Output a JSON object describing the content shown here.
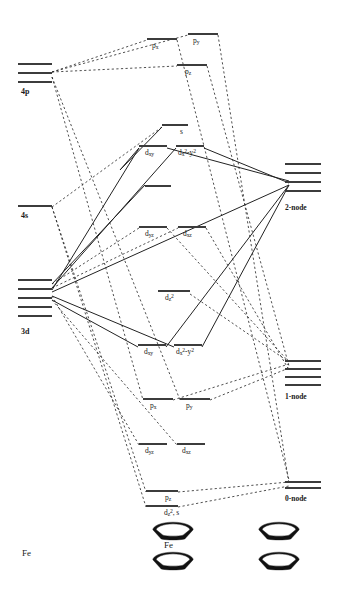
{
  "diagram": {
    "title_label": "Fe",
    "type": "ferrocene-molecular-orbital-correlation-diagram"
  },
  "left_atom": {
    "label": "Fe",
    "levels": [
      {
        "name": "4p",
        "label": "4p",
        "degeneracy": 3,
        "x": 18,
        "y": 63,
        "width": 34,
        "spacing": 9,
        "label_x": 21,
        "label_y": 88
      },
      {
        "name": "4s",
        "label": "4s",
        "degeneracy": 1,
        "x": 18,
        "y": 205,
        "width": 34,
        "spacing": 0,
        "label_x": 21,
        "label_y": 212
      },
      {
        "name": "3d",
        "label": "3d",
        "degeneracy": 5,
        "x": 18,
        "y": 279,
        "width": 34,
        "spacing": 9,
        "label_x": 21,
        "label_y": 328
      }
    ]
  },
  "molecular_orbitals": [
    {
      "name": "mo-px-antibonding",
      "label_html": "p<sub>x</sub>",
      "x": 147,
      "y": 38,
      "width": 30,
      "label_x": 152,
      "label_y": 42,
      "label_above": true
    },
    {
      "name": "mo-py-antibonding",
      "label_html": "p<sub>y</sub>",
      "x": 188,
      "y": 33,
      "width": 30,
      "label_x": 193,
      "label_y": 37,
      "label_above": true
    },
    {
      "name": "mo-pz-antibonding",
      "label_html": "p<sub>z</sub>",
      "x": 177,
      "y": 64,
      "width": 30,
      "label_x": 185,
      "label_y": 68,
      "label_above": false
    },
    {
      "name": "mo-s-antibonding",
      "label_html": "s",
      "x": 162,
      "y": 124,
      "width": 26,
      "label_x": 180,
      "label_y": 128,
      "label_above": false
    },
    {
      "name": "mo-dxy-antibonding",
      "label_html": "d<sub>xy</sub>",
      "x": 139,
      "y": 145,
      "width": 28,
      "label_x": 145,
      "label_y": 149,
      "label_above": true
    },
    {
      "name": "mo-dx2y2-antibonding",
      "label_html": "d<sub>x</sub><sup>2</sup>-y<sup>2</sup>",
      "x": 176,
      "y": 145,
      "width": 28,
      "label_x": 178,
      "label_y": 149,
      "label_above": true
    },
    {
      "name": "mo-nonbonding-mid",
      "label_html": "",
      "x": 145,
      "y": 185,
      "width": 26,
      "label_x": 0,
      "label_y": 0,
      "label_above": false
    },
    {
      "name": "mo-dyz-nonbonding",
      "label_html": "d<sub>yz</sub>",
      "x": 139,
      "y": 226,
      "width": 28,
      "label_x": 145,
      "label_y": 230,
      "label_above": true
    },
    {
      "name": "mo-dxz-nonbonding",
      "label_html": "d<sub>xz</sub>",
      "x": 178,
      "y": 226,
      "width": 28,
      "label_x": 183,
      "label_y": 230,
      "label_above": true
    },
    {
      "name": "mo-dz2-nonbonding",
      "label_html": "d<sub>z</sub><sup>2</sup>",
      "x": 158,
      "y": 290,
      "width": 32,
      "label_x": 165,
      "label_y": 294,
      "label_above": false
    },
    {
      "name": "mo-dxy-bonding",
      "label_html": "d<sub>xy</sub>",
      "x": 138,
      "y": 344,
      "width": 28,
      "label_x": 144,
      "label_y": 348,
      "label_above": false
    },
    {
      "name": "mo-dx2y2-bonding",
      "label_html": "d<sub>x</sub><sup>2</sup>-y<sup>2</sup>",
      "x": 174,
      "y": 344,
      "width": 28,
      "label_x": 176,
      "label_y": 348,
      "label_above": false
    },
    {
      "name": "mo-px-bonding",
      "label_html": "p<sub>x</sub>",
      "x": 143,
      "y": 398,
      "width": 30,
      "label_x": 150,
      "label_y": 402,
      "label_above": false
    },
    {
      "name": "mo-py-bonding",
      "label_html": "p<sub>y</sub>",
      "x": 180,
      "y": 398,
      "width": 30,
      "label_x": 186,
      "label_y": 402,
      "label_above": false
    },
    {
      "name": "mo-dyz-bonding",
      "label_html": "d<sub>yz</sub>",
      "x": 139,
      "y": 443,
      "width": 28,
      "label_x": 145,
      "label_y": 447,
      "label_above": true
    },
    {
      "name": "mo-dxz-bonding",
      "label_html": "d<sub>xz</sub>",
      "x": 177,
      "y": 443,
      "width": 28,
      "label_x": 182,
      "label_y": 447,
      "label_above": true
    },
    {
      "name": "mo-pz-bonding",
      "label_html": "p<sub>z</sub>",
      "x": 146,
      "y": 490,
      "width": 32,
      "label_x": 165,
      "label_y": 494,
      "label_above": false
    },
    {
      "name": "mo-dz2-s-bonding",
      "label_html": "d<sub>z</sub><sup>2</sup>, s",
      "x": 146,
      "y": 505,
      "width": 32,
      "label_x": 164,
      "label_y": 509,
      "label_above": false
    }
  ],
  "ligand_groups": [
    {
      "name": "ligand-group-2-node",
      "label": "2-node",
      "degeneracy": 4,
      "x": 285,
      "y": 163,
      "width": 36,
      "spacing": 9,
      "label_x": 285,
      "label_y": 203
    },
    {
      "name": "ligand-group-1-node",
      "label": "1-node",
      "degeneracy": 4,
      "x": 285,
      "y": 360,
      "width": 36,
      "spacing": 8,
      "label_x": 285,
      "label_y": 392
    },
    {
      "name": "ligand-group-0-node",
      "label": "0-node",
      "degeneracy": 2,
      "x": 285,
      "y": 481,
      "width": 36,
      "spacing": 6,
      "label_x": 285,
      "label_y": 494
    }
  ],
  "structures": {
    "ferrocene": {
      "name": "ferrocene-structure",
      "metal_label": "Fe",
      "x": 152,
      "y": 521
    },
    "cp_ligands": {
      "name": "cyclopentadienyl-ligands-structure",
      "x": 258,
      "y": 521
    }
  },
  "colors": {
    "level_line": "#3c3c3c",
    "correlation_line": "#222222",
    "ring_fill": "#111111",
    "background": "#ffffff"
  },
  "correlation_lines": {
    "solid": [
      [
        52,
        284,
        145,
        185
      ],
      [
        52,
        288,
        176,
        148
      ],
      [
        52,
        290,
        139,
        148
      ],
      [
        52,
        292,
        289,
        185
      ],
      [
        52,
        296,
        174,
        347
      ],
      [
        52,
        300,
        138,
        347
      ],
      [
        167,
        148,
        289,
        181
      ],
      [
        204,
        148,
        289,
        183
      ],
      [
        289,
        185,
        202,
        347
      ],
      [
        289,
        185,
        166,
        347
      ],
      [
        139,
        148,
        120,
        170
      ],
      [
        120,
        170,
        162,
        127
      ]
    ],
    "dashed": [
      [
        52,
        72,
        147,
        40
      ],
      [
        52,
        72,
        177,
        66
      ],
      [
        52,
        72,
        188,
        35
      ],
      [
        52,
        207,
        162,
        127
      ],
      [
        52,
        207,
        146,
        492
      ],
      [
        52,
        207,
        146,
        507
      ],
      [
        52,
        77,
        143,
        400
      ],
      [
        52,
        77,
        180,
        400
      ],
      [
        52,
        284,
        139,
        228
      ],
      [
        52,
        288,
        178,
        228
      ],
      [
        52,
        296,
        139,
        445
      ],
      [
        52,
        300,
        177,
        445
      ],
      [
        177,
        40,
        289,
        480
      ],
      [
        218,
        35,
        289,
        484
      ],
      [
        207,
        66,
        289,
        366
      ],
      [
        173,
        400,
        289,
        364
      ],
      [
        210,
        400,
        289,
        368
      ],
      [
        167,
        228,
        289,
        362
      ],
      [
        206,
        228,
        289,
        370
      ],
      [
        178,
        492,
        289,
        482
      ],
      [
        178,
        507,
        289,
        486
      ],
      [
        190,
        294,
        289,
        362
      ]
    ]
  }
}
